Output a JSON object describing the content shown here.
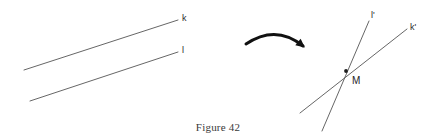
{
  "figure": {
    "caption": "Figure 42",
    "background_color": "#ffffff",
    "stroke_color": "#555555",
    "arrow_color": "#111111",
    "label_color": "#2b2b2b"
  },
  "left_diagram": {
    "description": "two parallel lines",
    "lines": [
      {
        "id": "line-k",
        "label": "k",
        "x1": 24,
        "y1": 70,
        "x2": 178,
        "y2": 20,
        "label_x": 182,
        "label_y": 14
      },
      {
        "id": "line-l",
        "label": "l",
        "x1": 30,
        "y1": 101,
        "x2": 178,
        "y2": 52,
        "label_x": 182,
        "label_y": 46
      }
    ]
  },
  "arrow": {
    "id": "transform-arrow",
    "start_x": 246,
    "start_y": 44,
    "control_x": 276,
    "control_y": 24,
    "end_x": 303,
    "end_y": 46
  },
  "right_diagram": {
    "description": "two intersecting lines meeting at point M",
    "lines": [
      {
        "id": "line-l-prime",
        "label": "l'",
        "x1": 322,
        "y1": 131,
        "x2": 369,
        "y2": 21,
        "label_x": 371,
        "label_y": 11
      },
      {
        "id": "line-k-prime",
        "label": "k'",
        "x1": 300,
        "y1": 113,
        "x2": 407,
        "y2": 29,
        "label_x": 410,
        "label_y": 23
      }
    ],
    "intersection": {
      "id": "point-m",
      "label": "M",
      "x": 346,
      "y": 71,
      "label_x": 352,
      "label_y": 76
    }
  }
}
